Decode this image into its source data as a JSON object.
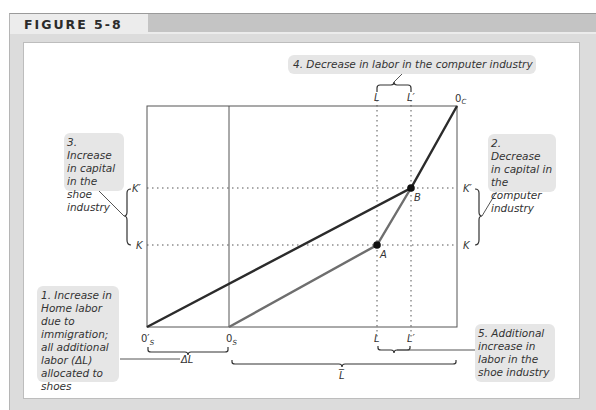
{
  "figure": {
    "title": "FIGURE 5-8"
  },
  "callouts": {
    "c1": "1. Increase in Home labor due to immigration; all additional labor (ΔL) allocated to shoes",
    "c2": "2. Decrease in capital in the computer industry",
    "c3": "3. Increase in capital in the shoe industry",
    "c4": "4. Decrease in labor in the computer industry",
    "c5": "5. Additional increase in labor in the shoe industry"
  },
  "labels": {
    "origin_shoes_new": "0′",
    "origin_shoes_new_sub": "S",
    "origin_shoes": "0",
    "origin_shoes_sub": "S",
    "origin_computers": "0",
    "origin_computers_sub": "C",
    "L_top": "L",
    "L_prime_top": "L′",
    "L_bottom": "L",
    "L_prime_bottom": "L′",
    "K_left": "K",
    "K_prime_left": "K′",
    "K_right": "K",
    "K_prime_right": "K′",
    "point_A": "A",
    "point_B": "B",
    "delta_L": "ΔL",
    "L_bar": "L̅"
  },
  "colors": {
    "line_dark": "#2b2b2b",
    "line_gray": "#6e6e6e",
    "callout_bg": "#e6e6e6",
    "frame_bg": "#dcdcdc"
  }
}
